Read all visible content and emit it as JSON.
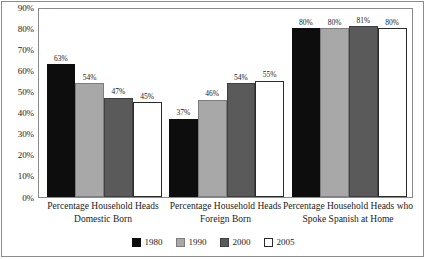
{
  "chart_data": {
    "type": "bar",
    "title": "",
    "subtitle": "",
    "xlabel": "",
    "ylabel": "",
    "ylim": [
      0,
      90
    ],
    "y_tick_labels": [
      "90%",
      "80%",
      "70%",
      "60%",
      "50%",
      "40%",
      "30%",
      "20%",
      "10%",
      "0%"
    ],
    "y_tick_values": [
      90,
      80,
      70,
      60,
      50,
      40,
      30,
      20,
      10,
      0
    ],
    "grid": false,
    "legend_position": "bottom-center",
    "value_label_suffix": "%",
    "categories": [
      "Percentage Household Heads Domestic Born",
      "Percentage Household Heads Foreign Born",
      "Percentage Household Heads who Spoke Spanish at Home"
    ],
    "category_lines": [
      [
        "Percentage Household Heads",
        "Domestic Born"
      ],
      [
        "Percentage Household Heads",
        "Foreign Born"
      ],
      [
        "Percentage Household Heads who",
        "Spoke Spanish at Home"
      ]
    ],
    "series": [
      {
        "name": "1980",
        "color": "#0d0d0d",
        "values": [
          63,
          37,
          80
        ],
        "value_labels": [
          "63%",
          "37%",
          "80%"
        ]
      },
      {
        "name": "1990",
        "color": "#a8a8a8",
        "values": [
          54,
          46,
          80
        ],
        "value_labels": [
          "54%",
          "46%",
          "80%"
        ]
      },
      {
        "name": "2000",
        "color": "#5a5a5a",
        "values": [
          47,
          54,
          81
        ],
        "value_labels": [
          "47%",
          "54%",
          "81%"
        ]
      },
      {
        "name": "2005",
        "color": "#ffffff",
        "values": [
          45,
          55,
          80
        ],
        "value_labels": [
          "45%",
          "55%",
          "80%"
        ]
      }
    ]
  }
}
